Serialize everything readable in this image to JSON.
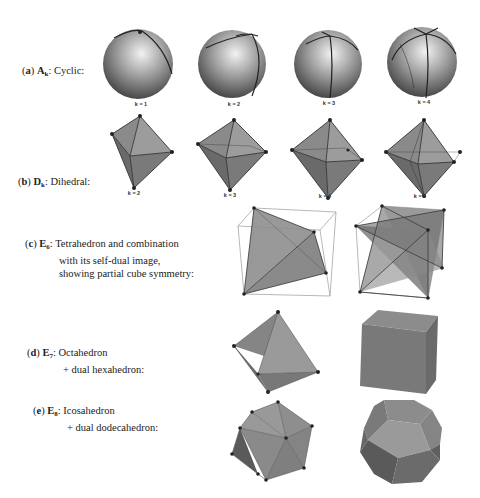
{
  "rows": [
    {
      "id": "a",
      "letter": "a",
      "group": "A",
      "subscript": "k",
      "lines": [
        "Cyclic:"
      ],
      "figures": [
        {
          "kind": "sphere",
          "label": "k = 1"
        },
        {
          "kind": "sphere",
          "label": "k = 2"
        },
        {
          "kind": "sphere",
          "label": "k = 3"
        },
        {
          "kind": "sphere",
          "label": "k = 4"
        }
      ]
    },
    {
      "id": "b",
      "letter": "b",
      "group": "D",
      "subscript": "k",
      "lines": [
        "Dihedral:"
      ],
      "figures": [
        {
          "kind": "bipyramid",
          "label": "k = 2"
        },
        {
          "kind": "bipyramid",
          "label": "k = 3"
        },
        {
          "kind": "bipyramid",
          "label": "k = 4"
        },
        {
          "kind": "bipyramid",
          "label": "k = 5"
        }
      ]
    },
    {
      "id": "c",
      "letter": "c",
      "group": "E",
      "subscript": "6",
      "lines": [
        "Tetrahedron and combination",
        "with its self-dual image,",
        "showing partial cube symmetry:"
      ],
      "figures": [
        {
          "kind": "tetrahedron-in-cube"
        },
        {
          "kind": "stella-octangula-in-cube"
        }
      ]
    },
    {
      "id": "d",
      "letter": "d",
      "group": "E",
      "subscript": "7",
      "lines": [
        "Octahedron",
        "+ dual hexahedron:"
      ],
      "figures": [
        {
          "kind": "octahedron"
        },
        {
          "kind": "cube"
        }
      ]
    },
    {
      "id": "e",
      "letter": "e",
      "group": "E",
      "subscript": "8",
      "lines": [
        "Icosahedron",
        "+ dual dodecahedron:"
      ],
      "figures": [
        {
          "kind": "icosahedron"
        },
        {
          "kind": "dodecahedron"
        }
      ]
    }
  ],
  "colors": {
    "face_light": "#9a9a9a",
    "face_mid": "#7e7e7e",
    "face_dark": "#5f5f5f",
    "edge": "#333333",
    "vertex": "#222222",
    "cube_wire": "#888888"
  }
}
